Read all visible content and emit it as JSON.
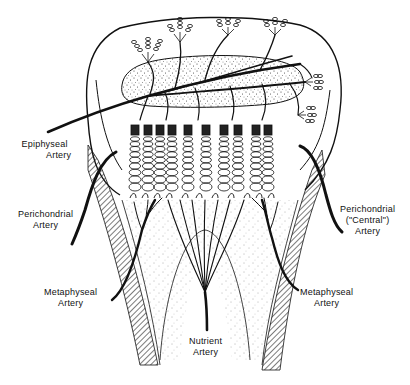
{
  "diagram": {
    "type": "anatomical line drawing",
    "stroke_color": "#111111",
    "background": "#ffffff"
  },
  "labels": {
    "epiphyseal": {
      "line1": "Epiphyseal",
      "line2": "Artery"
    },
    "perichondrial_left": {
      "line1": "Perichondrial",
      "line2": "Artery"
    },
    "perichondrial_right": {
      "line1": "Perichondrial",
      "line2": "(\"Central\")",
      "line3": "Artery"
    },
    "metaphyseal_left": {
      "line1": "Metaphyseal",
      "line2": "Artery"
    },
    "metaphyseal_right": {
      "line1": "Metaphyseal",
      "line2": "Artery"
    },
    "nutrient": {
      "line1": "Nutrient",
      "line2": "Artery"
    }
  }
}
